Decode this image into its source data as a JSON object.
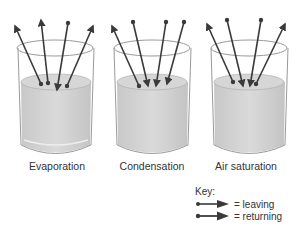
{
  "diagram": {
    "beakers": [
      {
        "label": "Evaporation",
        "leaving": 3,
        "returning": 1
      },
      {
        "label": "Condensation",
        "leaving": 1,
        "returning": 3
      },
      {
        "label": "Air saturation",
        "leaving": 2,
        "returning": 2
      }
    ],
    "key": {
      "title": "Key:",
      "items": [
        {
          "symbol": "arrow-leaving",
          "label": "= leaving"
        },
        {
          "symbol": "arrow-returning",
          "label": "= returning"
        }
      ]
    },
    "colors": {
      "arrow": "#3a3a3a",
      "liquid": "#d2d2d2",
      "glass": "#9a9a9a"
    }
  }
}
